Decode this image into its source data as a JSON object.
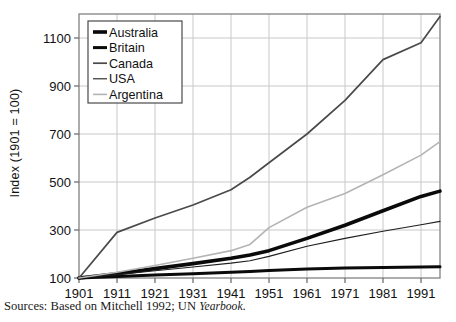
{
  "axis": {
    "ylabel": "Index (1901 = 100)",
    "yticks": [
      "100",
      "300",
      "500",
      "700",
      "900",
      "1100"
    ],
    "xticks": [
      "1901",
      "1911",
      "1921",
      "1931",
      "1941",
      "1951",
      "1961",
      "1971",
      "1981",
      "1991"
    ]
  },
  "legend": {
    "items": [
      {
        "label": "Australia",
        "swatch": "thick-black-line-icon"
      },
      {
        "label": "Britain",
        "swatch": "thick-black-line-icon"
      },
      {
        "label": "Canada",
        "swatch": "medium-gray-line-icon"
      },
      {
        "label": "USA",
        "swatch": "thin-dark-line-icon"
      },
      {
        "label": "Argentina",
        "swatch": "light-gray-line-icon"
      }
    ]
  },
  "source": {
    "prefix": "Sources: Based on Mitchell 1992; UN ",
    "italic": "Yearbook",
    "suffix": "."
  },
  "colors": {
    "australia": "#0a0a0a",
    "britain": "#0a0a0a",
    "canada": "#4a4a4a",
    "usa": "#1e1e1e",
    "argentina": "#b4b4b4",
    "grid": "#c8c8c8",
    "frame": "#8a8a8a"
  },
  "chart_data": {
    "type": "line",
    "title": "",
    "xlabel": "",
    "ylabel": "Index (1901 = 100)",
    "xlim": [
      1901,
      1996
    ],
    "ylim": [
      100,
      1200
    ],
    "grid": true,
    "legend_position": "top-left",
    "x": [
      1901,
      1911,
      1921,
      1931,
      1941,
      1946,
      1951,
      1961,
      1971,
      1981,
      1991,
      1996
    ],
    "series": [
      {
        "name": "Australia",
        "values": [
          100,
          118,
          139,
          160,
          182,
          196,
          214,
          265,
          320,
          380,
          440,
          462
        ]
      },
      {
        "name": "Britain",
        "values": [
          100,
          106,
          112,
          118,
          124,
          127,
          131,
          137,
          142,
          144,
          146,
          147
        ]
      },
      {
        "name": "Canada",
        "values": [
          100,
          290,
          350,
          404,
          468,
          520,
          580,
          700,
          840,
          1010,
          1080,
          1190
        ]
      },
      {
        "name": "USA",
        "values": [
          100,
          114,
          130,
          146,
          162,
          172,
          190,
          232,
          265,
          295,
          322,
          336
        ]
      },
      {
        "name": "Argentina",
        "values": [
          100,
          124,
          152,
          182,
          214,
          240,
          310,
          395,
          452,
          530,
          612,
          668
        ]
      }
    ]
  }
}
